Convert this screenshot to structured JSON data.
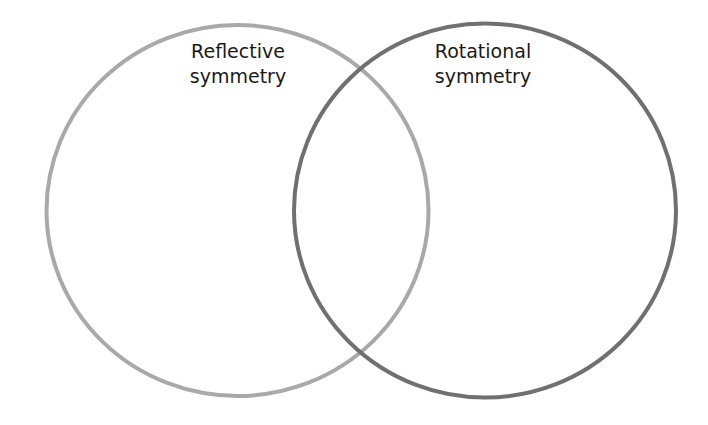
{
  "diagram": {
    "type": "venn",
    "sets": [
      {
        "id": "reflective",
        "label_lines": [
          "Reflective",
          "symmetry"
        ],
        "stroke_color": "#a9a9a9"
      },
      {
        "id": "rotational",
        "label_lines": [
          "Rotational",
          "symmetry"
        ],
        "stroke_color": "#707070"
      }
    ]
  }
}
